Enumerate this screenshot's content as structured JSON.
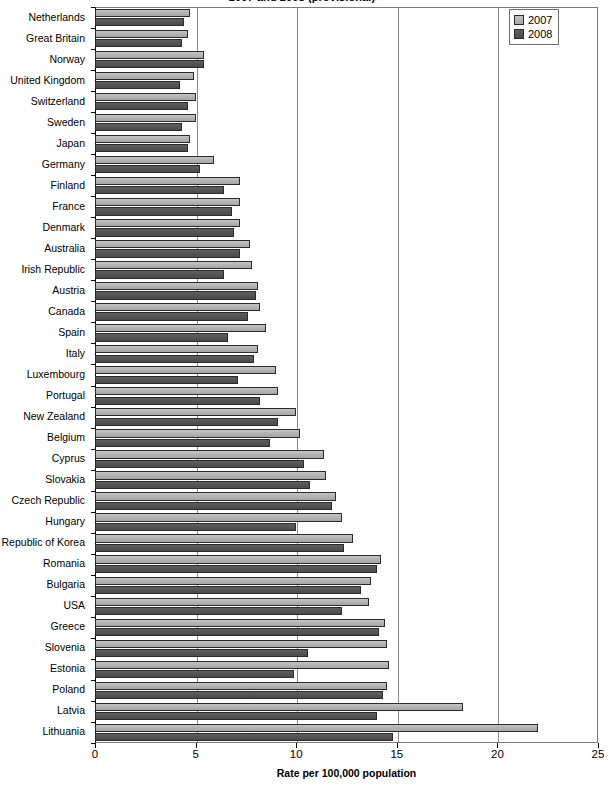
{
  "chart_data": {
    "type": "bar",
    "orientation": "horizontal",
    "title": "2007 and 2008 (provisional)",
    "xlabel": "Rate per 100,000 population",
    "ylabel": "",
    "xlim": [
      0,
      25
    ],
    "xticks": [
      0,
      5,
      10,
      15,
      20,
      25
    ],
    "grid": true,
    "legend_position": "top-right",
    "categories": [
      "Netherlands",
      "Great Britain",
      "Norway",
      "United Kingdom",
      "Switzerland",
      "Sweden",
      "Japan",
      "Germany",
      "Finland",
      "France",
      "Denmark",
      "Australia",
      "Irish Republic",
      "Austria",
      "Canada",
      "Spain",
      "Italy",
      "Luxembourg",
      "Portugal",
      "New Zealand",
      "Belgium",
      "Cyprus",
      "Slovakia",
      "Czech Republic",
      "Hungary",
      "Republic of Korea",
      "Romania",
      "Bulgaria",
      "USA",
      "Greece",
      "Slovenia",
      "Estonia",
      "Poland",
      "Latvia",
      "Lithuania"
    ],
    "series": [
      {
        "name": "2007",
        "color": "#b4b4b4",
        "values": [
          4.7,
          4.6,
          5.4,
          4.9,
          5.0,
          5.0,
          4.7,
          5.9,
          7.2,
          7.2,
          7.2,
          7.7,
          7.8,
          8.1,
          8.2,
          8.5,
          8.1,
          9.0,
          9.1,
          10.0,
          10.2,
          11.4,
          11.5,
          12.0,
          12.3,
          12.8,
          14.2,
          13.7,
          13.6,
          14.4,
          14.5,
          14.6,
          14.5,
          18.3,
          22.0
        ]
      },
      {
        "name": "2008",
        "color": "#545454",
        "values": [
          4.4,
          4.3,
          5.4,
          4.2,
          4.6,
          4.3,
          4.6,
          5.2,
          6.4,
          6.8,
          6.9,
          7.2,
          6.4,
          8.0,
          7.6,
          6.6,
          7.9,
          7.1,
          8.2,
          9.1,
          8.7,
          10.4,
          10.7,
          11.8,
          10.0,
          12.4,
          14.0,
          13.2,
          12.3,
          14.1,
          10.6,
          9.9,
          14.3,
          14.0,
          14.8
        ]
      }
    ]
  },
  "legend": {
    "items": [
      {
        "label": "2007",
        "color": "#b4b4b4"
      },
      {
        "label": "2008",
        "color": "#545454"
      }
    ]
  }
}
